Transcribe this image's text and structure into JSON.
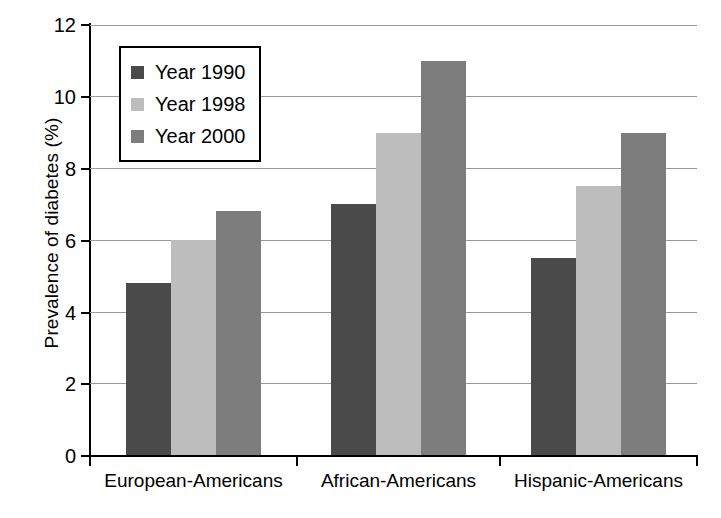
{
  "chart_data": {
    "type": "bar",
    "title": "",
    "xlabel": "",
    "ylabel": "Prevalence of diabetes (%)",
    "categories": [
      "European-Americans",
      "African-Americans",
      "Hispanic-Americans"
    ],
    "series": [
      {
        "name": "Year 1990",
        "color": "#4a4a4a",
        "values": [
          4.8,
          7.0,
          5.5
        ]
      },
      {
        "name": "Year 1998",
        "color": "#bdbdbd",
        "values": [
          6.0,
          9.0,
          7.5
        ]
      },
      {
        "name": "Year 2000",
        "color": "#7d7d7d",
        "values": [
          6.8,
          11.0,
          9.0
        ]
      }
    ],
    "ylim": [
      0,
      12
    ],
    "yticks": [
      0,
      2,
      4,
      6,
      8,
      10,
      12
    ],
    "ytick_labels": [
      "0",
      "2",
      "4",
      "6",
      "8",
      "10",
      "12"
    ],
    "grid": true,
    "grid_axis": "y",
    "legend_position": "upper-left-inside",
    "axis_color": "#000000",
    "grid_color": "#9a9a9a",
    "background": "#ffffff"
  }
}
